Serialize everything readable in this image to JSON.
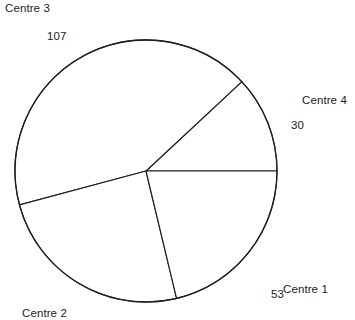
{
  "chart_data": {
    "type": "pie",
    "title": "",
    "categories": [
      "Centre 1",
      "Centre 2",
      "Centre 3",
      "Centre 4"
    ],
    "values": [
      53,
      63,
      107,
      30
    ],
    "labels_shown": [
      "Centre 3",
      "Centre 4",
      "Centre 1",
      "Centre 2"
    ],
    "values_shown": [
      "107",
      "30",
      "53"
    ],
    "legend": "none",
    "grid": false,
    "slices": [
      {
        "name": "Centre 4",
        "value": 30,
        "value_text": "30",
        "label_text": "Centre 4",
        "start_angle_deg": 0,
        "end_angle_deg": 43,
        "sweep_deg": 43,
        "color": "#ffffff"
      },
      {
        "name": "Centre 3",
        "value": 107,
        "value_text": "107",
        "label_text": "Centre 3",
        "start_angle_deg": 43,
        "end_angle_deg": 195,
        "sweep_deg": 152,
        "color": "#ffffff"
      },
      {
        "name": "Centre 2",
        "value": 63,
        "value_text": "",
        "label_text": "Centre 2",
        "start_angle_deg": 195,
        "end_angle_deg": 283.5,
        "sweep_deg": 88.5,
        "color": "#ffffff"
      },
      {
        "name": "Centre 1",
        "value": 53,
        "value_text": "53",
        "label_text": "Centre 1",
        "start_angle_deg": 283.5,
        "end_angle_deg": 360,
        "sweep_deg": 76.5,
        "color": "#ffffff"
      }
    ],
    "geometry": {
      "center_x": 146,
      "center_y": 171,
      "radius": 131
    },
    "style": {
      "line_color": "#1f1f1f",
      "fill_color": "#ffffff",
      "background": "#ffffff",
      "text_color": "#1c1c1c"
    }
  }
}
